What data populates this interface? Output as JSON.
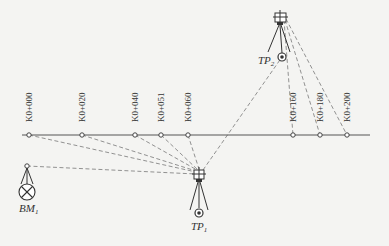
{
  "diagram": {
    "type": "leveling-profile",
    "axis": {
      "y": 135,
      "x_start": 22,
      "x_end": 370
    },
    "stations": [
      {
        "label": "K0+000",
        "x": 29
      },
      {
        "label": "K0+020",
        "x": 82
      },
      {
        "label": "K0+040",
        "x": 135
      },
      {
        "label": "K0+051",
        "x": 161
      },
      {
        "label": "K0+060",
        "x": 188
      },
      {
        "label": "K0+160",
        "x": 293
      },
      {
        "label": "K0+180",
        "x": 320
      },
      {
        "label": "K0+200",
        "x": 347
      }
    ],
    "benchmark": {
      "label": "BM",
      "sub": "1",
      "staff_x": 27,
      "staff_y": 166,
      "mark_x": 27,
      "mark_y": 192
    },
    "turning_points": [
      {
        "label": "TP",
        "sub": "1",
        "inst_x": 199,
        "inst_y": 175,
        "mark_x": 199,
        "mark_y": 213
      },
      {
        "label": "TP",
        "sub": "2",
        "inst_x": 280,
        "inst_y": 18,
        "mark_x": 282,
        "mark_y": 57
      }
    ],
    "colors": {
      "line": "#555555",
      "sight": "#777777",
      "background": "#f4f4f2"
    }
  }
}
